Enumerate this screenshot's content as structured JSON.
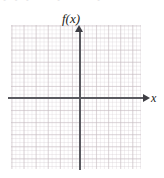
{
  "figure": {
    "kind": "blank-coordinate-grid",
    "background_color": "#ffffff",
    "width_px": 164,
    "height_px": 178
  },
  "top_artifacts": {
    "fragment_left": "• • •",
    "fragment_mid": "•",
    "fragment_right": "•"
  },
  "grid": {
    "major_line_color": "#c4b8be",
    "minor_line_color": "#d6ced4",
    "major_cell_px": 12,
    "minor_cell_px": 4,
    "columns": 11,
    "rows": 12
  },
  "axes": {
    "color": "#59595f",
    "arrow_color": "#3f3f45",
    "x": {
      "label": "x",
      "has_arrow": true,
      "arrow_direction": "right"
    },
    "y": {
      "label": "f(x)",
      "has_arrow": true,
      "arrow_direction": "up"
    },
    "origin_x_px": 80,
    "origin_y_px": 98
  },
  "chart_data": {
    "type": "line",
    "title": "",
    "xlabel": "x",
    "ylabel": "f(x)",
    "series": [],
    "categories": [],
    "values": [],
    "xlim": [
      -6,
      5
    ],
    "ylim": [
      -6,
      6
    ],
    "grid": true,
    "legend": "none",
    "annotations": [],
    "note": "Empty graph-paper axes; no data plotted."
  }
}
